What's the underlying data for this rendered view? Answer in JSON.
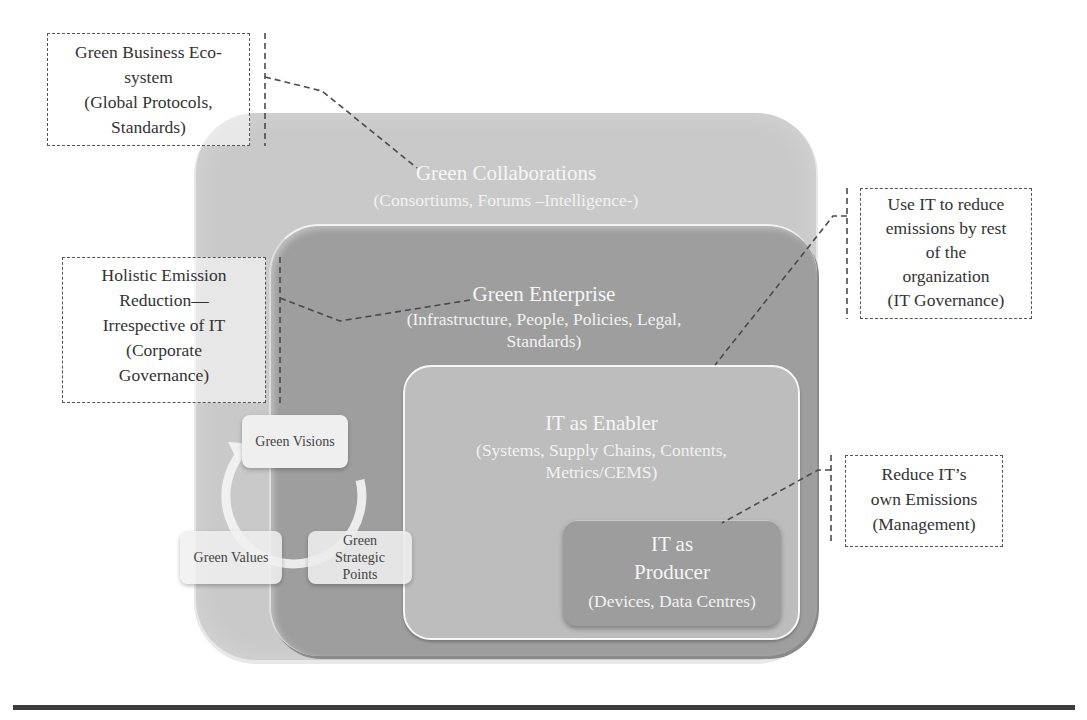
{
  "layers": {
    "collaborations": {
      "title": "Green Collaborations",
      "subtitle": "(Consortiums, Forums –Intelligence-)"
    },
    "enterprise": {
      "title": "Green Enterprise",
      "subtitle_line1": "(Infrastructure, People, Policies, Legal,",
      "subtitle_line2": "Standards)"
    },
    "enabler": {
      "title": "IT as Enabler",
      "subtitle_line1": "(Systems, Supply Chains, Contents,",
      "subtitle_line2": "Metrics/CEMS)"
    },
    "producer": {
      "title_line1": "IT as",
      "title_line2": "Producer",
      "subtitle": "(Devices, Data Centres)"
    }
  },
  "callouts": {
    "ecosystem": {
      "lines": [
        "Green Business Eco-",
        "system",
        "(Global Protocols,",
        "Standards)"
      ]
    },
    "holistic": {
      "lines": [
        "Holistic Emission",
        "Reduction—",
        "Irrespective of IT",
        "(Corporate",
        "Governance)"
      ]
    },
    "use_it": {
      "lines": [
        "Use IT to reduce",
        "emissions by rest",
        "of the",
        "organization",
        "(IT Governance)"
      ]
    },
    "reduce_it": {
      "lines": [
        "Reduce IT’s",
        "own Emissions",
        "(Management)"
      ]
    }
  },
  "cycle": {
    "visions": "Green Visions",
    "values": "Green Values",
    "strategic_lines": [
      "Green",
      "Strategic",
      "Points"
    ]
  }
}
